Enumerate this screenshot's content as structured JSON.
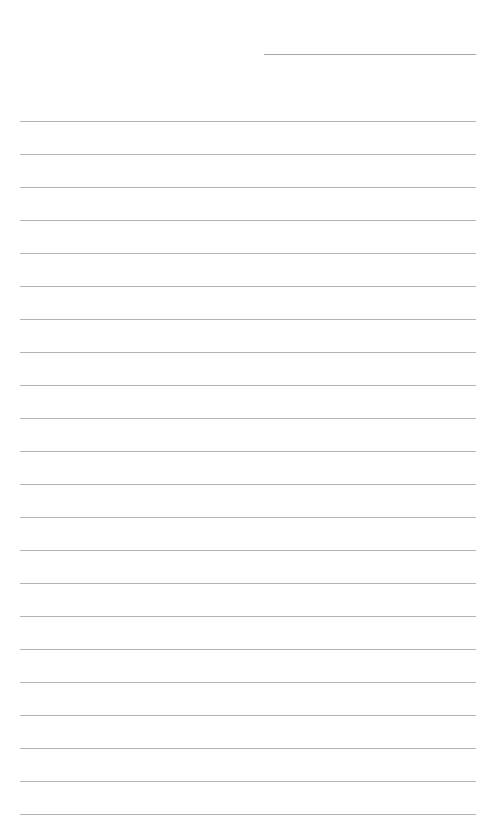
{
  "page": {
    "type": "lined-paper",
    "background_color": "#ffffff",
    "line_color": "#b4b4b4",
    "header_line": {
      "present": true
    },
    "ruled_line_count": 22,
    "ruled_lines_top_px": [
      121,
      154,
      187,
      220,
      253,
      286,
      319,
      352,
      385,
      418,
      451,
      484,
      517,
      550,
      583,
      616,
      649,
      682,
      715,
      748,
      781,
      814
    ],
    "text_content": []
  }
}
